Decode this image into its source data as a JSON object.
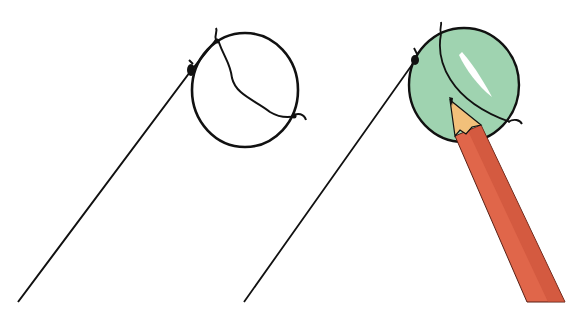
{
  "illustration": {
    "description": "Two-step drawing instruction: a lollipop-like ball on a string, first as line art, then colored green with a red pencil",
    "steps": [
      {
        "label": "Step 1 - line art",
        "fill": "none"
      },
      {
        "label": "Step 2 - colored",
        "fill": "#9fd3b0"
      }
    ],
    "colors": {
      "outline": "#111111",
      "ball_green": "#9fd3b0",
      "ball_highlight": "#ffffff",
      "pencil_body": "#e0664a",
      "pencil_shade": "#c84e36",
      "pencil_wood": "#f2c07a",
      "background": "#ffffff"
    }
  }
}
